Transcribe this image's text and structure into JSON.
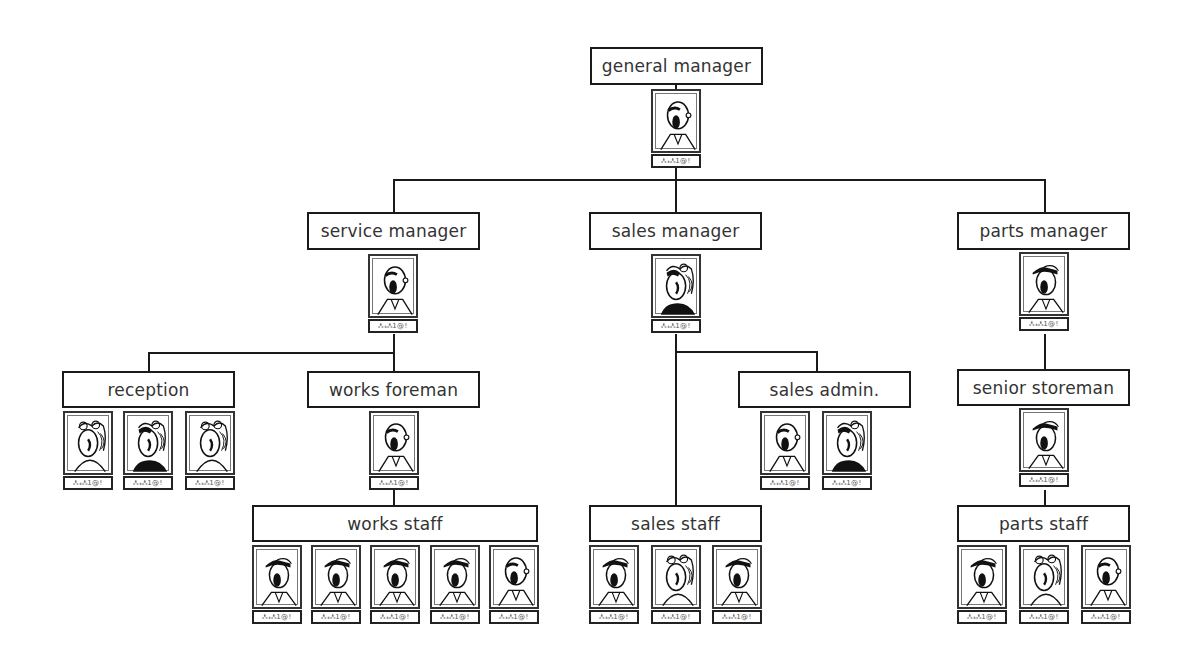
{
  "chart": {
    "nameplate_text": "ஃ𝓇ஃ1@!",
    "nodes": {
      "general_manager": {
        "label": "general manager",
        "staff": [
          "bald"
        ]
      },
      "service_manager": {
        "label": "service manager",
        "staff": [
          "bald"
        ]
      },
      "sales_manager": {
        "label": "sales manager",
        "staff": [
          "woman-dark"
        ]
      },
      "parts_manager": {
        "label": "parts manager",
        "staff": [
          "cap"
        ]
      },
      "reception": {
        "label": "reception",
        "staff": [
          "woman",
          "woman-dark",
          "woman"
        ]
      },
      "works_foreman": {
        "label": "works foreman",
        "staff": [
          "bald"
        ]
      },
      "sales_admin": {
        "label": "sales admin.",
        "staff": [
          "bald",
          "woman-dark"
        ]
      },
      "senior_storeman": {
        "label": "senior storeman",
        "staff": [
          "cap"
        ]
      },
      "works_staff": {
        "label": "works staff",
        "staff": [
          "cap",
          "cap",
          "cap",
          "cap",
          "bald"
        ]
      },
      "sales_staff": {
        "label": "sales staff",
        "staff": [
          "cap",
          "woman",
          "cap"
        ]
      },
      "parts_staff": {
        "label": "parts staff",
        "staff": [
          "cap",
          "woman",
          "bald"
        ]
      }
    },
    "hierarchy": [
      {
        "parent": "general_manager",
        "children": [
          "service_manager",
          "sales_manager",
          "parts_manager"
        ]
      },
      {
        "parent": "service_manager",
        "children": [
          "reception",
          "works_foreman"
        ]
      },
      {
        "parent": "works_foreman",
        "children": [
          "works_staff"
        ]
      },
      {
        "parent": "sales_manager",
        "children": [
          "sales_admin",
          "sales_staff"
        ]
      },
      {
        "parent": "parts_manager",
        "children": [
          "senior_storeman"
        ]
      },
      {
        "parent": "senior_storeman",
        "children": [
          "parts_staff"
        ]
      }
    ]
  }
}
